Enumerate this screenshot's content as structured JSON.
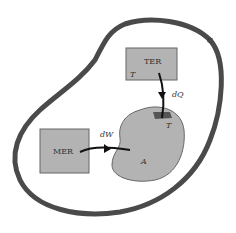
{
  "diagram": {
    "boundary_label": "C",
    "reservoir_thermal": {
      "label": "TER",
      "temp_label": "T"
    },
    "reservoir_mechanical": {
      "label": "MER"
    },
    "system": {
      "label": "A",
      "contact_temp_label": "T"
    },
    "heat_arrow_label": "dQ",
    "work_arrow_label": "dW",
    "colors": {
      "boundary": "#4a4a4a",
      "fill": "#b3b3b3",
      "contact": "#555555",
      "arrow": "#111111"
    }
  }
}
